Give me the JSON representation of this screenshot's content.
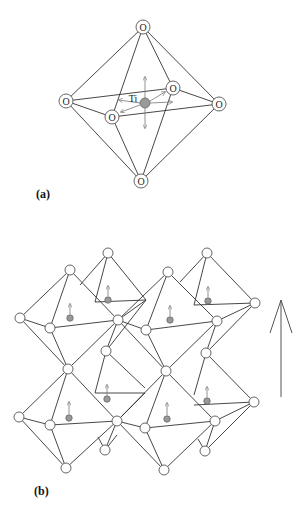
{
  "figure": {
    "panel_a": {
      "label": "(a)",
      "center_atom": "Ti",
      "corner_atom": "O",
      "corner_labels": [
        "O",
        "O",
        "O",
        "O",
        "O",
        "O"
      ]
    },
    "panel_b": {
      "label": "(b)",
      "description": "Network of corner-sharing TiO6 octahedra with Ti displacements aligned along polarization direction",
      "polarization_arrow": "up"
    },
    "colors": {
      "edge": "#333333",
      "ti_atom": "#999999",
      "background": "#ffffff"
    }
  }
}
